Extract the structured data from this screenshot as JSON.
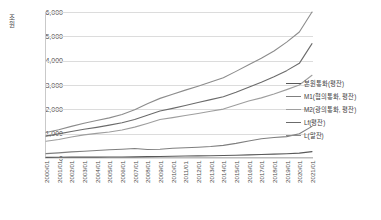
{
  "chart_data": {
    "type": "line",
    "title": "",
    "xlabel": "",
    "ylabel": "조원",
    "ylim": [
      0,
      6000
    ],
    "yticks": [
      "0",
      "1,000",
      "2,000",
      "3,000",
      "4,000",
      "5,000",
      "6,000"
    ],
    "ytick_values": [
      0,
      1000,
      2000,
      3000,
      4000,
      5000,
      6000
    ],
    "grid": true,
    "legend_position": "right",
    "categories": [
      "2000/01",
      "2001/01",
      "2002/01",
      "2003/01",
      "2004/01",
      "2005/01",
      "2006/01",
      "2007/01",
      "2008/01",
      "2009/01",
      "2010/01",
      "2011/01",
      "2012/01",
      "2013/01",
      "2014/01",
      "2015/01",
      "2016/01",
      "2017/01",
      "2018/01",
      "2019/01",
      "2020/01",
      "2021/01"
    ],
    "series": [
      {
        "name": "본원통화(평잔)",
        "color": "#595959",
        "values": [
          25,
          30,
          34,
          36,
          38,
          40,
          42,
          48,
          55,
          62,
          72,
          80,
          88,
          95,
          105,
          115,
          130,
          145,
          160,
          175,
          200,
          260
        ]
      },
      {
        "name": "M1(협의통화, 평잔)",
        "color": "#7f7f7f",
        "values": [
          180,
          210,
          250,
          280,
          310,
          340,
          360,
          390,
          350,
          360,
          400,
          420,
          440,
          470,
          520,
          600,
          700,
          790,
          840,
          880,
          1000,
          1300
        ]
      },
      {
        "name": "M2(광의통화, 평잔)",
        "color": "#9e9e9e",
        "values": [
          690,
          760,
          860,
          950,
          1010,
          1070,
          1150,
          1270,
          1420,
          1580,
          1660,
          1750,
          1830,
          1920,
          2010,
          2180,
          2340,
          2470,
          2630,
          2810,
          3000,
          3400
        ]
      },
      {
        "name": "Lf(평잔)",
        "color": "#6b6b6b",
        "values": [
          900,
          990,
          1090,
          1180,
          1260,
          1350,
          1450,
          1580,
          1760,
          1930,
          2040,
          2160,
          2280,
          2400,
          2520,
          2700,
          2910,
          3110,
          3340,
          3590,
          3890,
          4700
        ]
      },
      {
        "name": "L(말잔)",
        "color": "#8c8c8c",
        "values": [
          1050,
          1160,
          1300,
          1430,
          1540,
          1650,
          1790,
          1980,
          2230,
          2450,
          2620,
          2790,
          2950,
          3120,
          3300,
          3560,
          3830,
          4100,
          4400,
          4760,
          5180,
          6000
        ]
      }
    ]
  }
}
